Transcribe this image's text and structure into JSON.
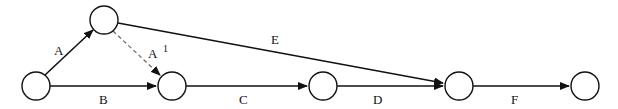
{
  "diagram": {
    "type": "activity-on-arrow network",
    "nodes": [
      {
        "id": "n1",
        "cx": 36,
        "cy": 86
      },
      {
        "id": "n2",
        "cx": 104,
        "cy": 20
      },
      {
        "id": "n3",
        "cx": 172,
        "cy": 86
      },
      {
        "id": "n4",
        "cx": 323,
        "cy": 86
      },
      {
        "id": "n5",
        "cx": 459,
        "cy": 86
      },
      {
        "id": "n6",
        "cx": 585,
        "cy": 86
      }
    ],
    "edges": [
      {
        "id": "A",
        "label": "A",
        "from": "n1",
        "to": "n2",
        "style": "solid"
      },
      {
        "id": "B",
        "label": "B",
        "from": "n1",
        "to": "n3",
        "style": "solid"
      },
      {
        "id": "A1",
        "label": "A",
        "label_sup": "1",
        "from": "n2",
        "to": "n3",
        "style": "dashed"
      },
      {
        "id": "C",
        "label": "C",
        "from": "n3",
        "to": "n4",
        "style": "solid"
      },
      {
        "id": "E",
        "label": "E",
        "from": "n2",
        "to": "n5",
        "style": "solid"
      },
      {
        "id": "D",
        "label": "D",
        "from": "n4",
        "to": "n5",
        "style": "solid"
      },
      {
        "id": "F",
        "label": "F",
        "from": "n5",
        "to": "n6",
        "style": "solid"
      }
    ],
    "colors": {
      "line": "#111111",
      "dashed": "#666666",
      "background": "#ffffff"
    }
  }
}
